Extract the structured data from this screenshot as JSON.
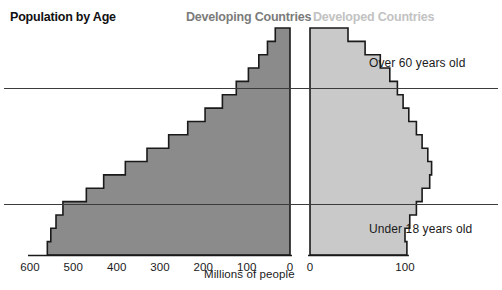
{
  "chart_title": "Population by Age",
  "legend": {
    "left": "Developing Countries",
    "right": "Developed Countries"
  },
  "annotations": {
    "over60": "Over 60 years old",
    "under18": "Under 18 years old"
  },
  "axis": {
    "unit_label": "Millions of people",
    "left_ticks": [
      "600",
      "500",
      "400",
      "300",
      "200",
      "100",
      "0"
    ],
    "right_ticks": [
      "0",
      "100"
    ]
  },
  "colors": {
    "developing_fill": "#8b8b8b",
    "developed_fill": "#c9c9c9",
    "outline": "#1a1a1a",
    "gridline": "#3b3b3b",
    "title_text": "#111111",
    "legend_developing_text": "#7b7b7b",
    "legend_developed_text": "#c2c2c2"
  },
  "chart_data": {
    "type": "bar",
    "title": "Population by Age",
    "xlabel": "Millions of people",
    "ylabel": "",
    "orientation": "horizontal",
    "grid": true,
    "legend_position": "top",
    "axis_reference_lines": [
      {
        "label": "Over 60 years old",
        "boundary": "age 60"
      },
      {
        "label": "Under 18 years old",
        "boundary": "age 18"
      }
    ],
    "left_axis": {
      "ticks": [
        600,
        500,
        400,
        300,
        200,
        100,
        0
      ],
      "max": 600,
      "direction": "reversed"
    },
    "right_axis": {
      "ticks": [
        0,
        100
      ],
      "max": 130,
      "direction": "normal"
    },
    "series": [
      {
        "name": "Developing Countries",
        "axis": "left",
        "units": "millions of people",
        "categories": [
          "0-4",
          "5-9",
          "10-14",
          "15-19",
          "20-24",
          "25-29",
          "30-34",
          "35-39",
          "40-44",
          "45-49",
          "50-54",
          "55-59",
          "60-64",
          "65-69",
          "70-74",
          "75-79",
          "80+"
        ],
        "values": [
          560,
          552,
          540,
          524,
          470,
          430,
          380,
          330,
          280,
          236,
          196,
          156,
          124,
          96,
          72,
          52,
          34
        ]
      },
      {
        "name": "Developed Countries",
        "axis": "right",
        "units": "millions of people",
        "categories": [
          "0-4",
          "5-9",
          "10-14",
          "15-19",
          "20-24",
          "25-29",
          "30-34",
          "35-39",
          "40-44",
          "45-49",
          "50-54",
          "55-59",
          "60-64",
          "65-69",
          "70-74",
          "75-79",
          "80+"
        ],
        "values": [
          102,
          100,
          105,
          112,
          118,
          126,
          128,
          124,
          118,
          112,
          104,
          98,
          92,
          84,
          74,
          58,
          40
        ]
      }
    ]
  }
}
